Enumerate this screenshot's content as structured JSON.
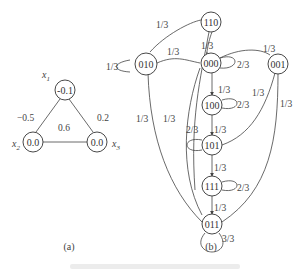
{
  "figure": {
    "caption_faded": true,
    "panel_a": {
      "label": "(a)",
      "nodes": [
        {
          "id": "x1",
          "var": "x",
          "sub": "1",
          "value": "-0.1"
        },
        {
          "id": "x2",
          "var": "x",
          "sub": "2",
          "value": "0.0"
        },
        {
          "id": "x3",
          "var": "x",
          "sub": "3",
          "value": "0.0"
        }
      ],
      "edges": [
        {
          "from": "x1",
          "to": "x2",
          "weight": "−0.5"
        },
        {
          "from": "x1",
          "to": "x3",
          "weight": "0.2"
        },
        {
          "from": "x2",
          "to": "x3",
          "weight": "0.6"
        }
      ]
    },
    "panel_b": {
      "label": "(b)",
      "nodes": [
        "110",
        "010",
        "000",
        "001",
        "100",
        "101",
        "111",
        "011"
      ],
      "edge_labels": {
        "n110_n010": "1/3",
        "n010_self": "1/3",
        "n010_n000": "1/3",
        "n110_n000": "1/3",
        "n000_self": "2/3",
        "n000_n001": "1/3",
        "n000_n100": "1/3",
        "n100_self": "2/3",
        "n001_n101": "1/3",
        "n001_n011": "1/3",
        "n101_self": "2/3",
        "n100_n101": "1/3",
        "n010_n011": "1/3",
        "n110_n111": "1/3",
        "n101_n111": "1/3",
        "n111_self": "2/3",
        "n111_n011": "1/3",
        "n011_self": "3/3"
      }
    }
  }
}
